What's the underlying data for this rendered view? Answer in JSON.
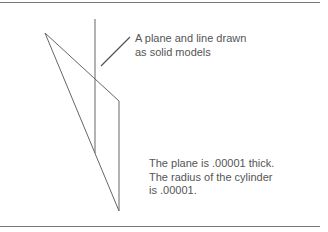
{
  "figure": {
    "callout": {
      "lines": [
        "A plane and line drawn",
        "as solid models"
      ]
    },
    "note": {
      "lines": [
        "The plane is .00001 thick.",
        "The radius of the cylinder",
        "is .00001."
      ]
    }
  },
  "colors": {
    "rule": "#777777",
    "stroke": "#666666",
    "text": "#555555"
  }
}
